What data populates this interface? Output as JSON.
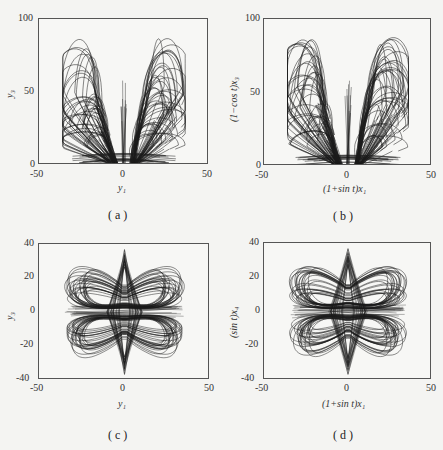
{
  "chart_data": [
    {
      "panel": "a",
      "type": "line",
      "title": "",
      "caption": "( a )",
      "xlabel": "y1",
      "ylabel": "y3",
      "xlim": [
        -50,
        50
      ],
      "ylim": [
        0,
        100
      ],
      "xticks": [
        "-50",
        "0",
        "50"
      ],
      "yticks": [
        "0",
        "50",
        "100"
      ],
      "grid": false,
      "description": "Chaotic attractor phase portrait: butterfly-shaped set of nested loops, two wings symmetric about y1=0, spanning x approx -35..35, y approx 0..88"
    },
    {
      "panel": "b",
      "type": "line",
      "title": "",
      "caption": "( b )",
      "xlabel": "(1+sin t)x1",
      "ylabel": "(1−cos t)x3",
      "xlim": [
        -50,
        50
      ],
      "ylim": [
        0,
        100
      ],
      "xticks": [
        "-50",
        "0",
        "50"
      ],
      "yticks": [
        "0",
        "50",
        "100"
      ],
      "grid": false,
      "description": "Same butterfly-shaped attractor as (a) in transformed coordinates"
    },
    {
      "panel": "c",
      "type": "line",
      "title": "",
      "caption": "( c )",
      "xlabel": "y1",
      "ylabel": "y3",
      "xlim": [
        -50,
        50
      ],
      "ylim": [
        -40,
        40
      ],
      "xticks": [
        "-50",
        "0",
        "50"
      ],
      "yticks": [
        "-40",
        "-20",
        "0",
        "20",
        "40"
      ],
      "grid": false,
      "description": "Hourglass / bow-tie attractor: upper and lower lobes of nested ellipses spanning x approx -35..35, y approx -37..38, with diamond-shaped spike at x=0"
    },
    {
      "panel": "d",
      "type": "line",
      "title": "",
      "caption": "( d )",
      "xlabel": "(1+sin t)x1",
      "ylabel": "(sin t)x4",
      "xlim": [
        -50,
        50
      ],
      "ylim": [
        -40,
        40
      ],
      "xticks": [
        "-50",
        "0",
        "50"
      ],
      "yticks": [
        "-40",
        "-20",
        "0",
        "20",
        "40"
      ],
      "grid": false,
      "description": "Same hourglass attractor as (c) in transformed coordinates"
    }
  ],
  "panels": {
    "a": {
      "caption": "( a )",
      "xlabel": "y₁",
      "ylabel": "y₃",
      "xticks": [
        "-50",
        "0",
        "50"
      ],
      "yticks": [
        "0",
        "50",
        "100"
      ]
    },
    "b": {
      "caption": "( b )",
      "xlabel": "(1+sin t)x₁",
      "ylabel": "(1−cos t)x₃",
      "xticks": [
        "-50",
        "0",
        "50"
      ],
      "yticks": [
        "0",
        "50",
        "100"
      ]
    },
    "c": {
      "caption": "( c )",
      "xlabel": "y₁",
      "ylabel": "y₃",
      "xticks": [
        "-50",
        "0",
        "50"
      ],
      "yticks": [
        "-40",
        "-20",
        "0",
        "20",
        "40"
      ]
    },
    "d": {
      "caption": "( d )",
      "xlabel": "(1+sin t)x₁",
      "ylabel": "(sin t)x₄",
      "xticks": [
        "-50",
        "0",
        "50"
      ],
      "yticks": [
        "-40",
        "-20",
        "0",
        "20",
        "40"
      ]
    }
  }
}
